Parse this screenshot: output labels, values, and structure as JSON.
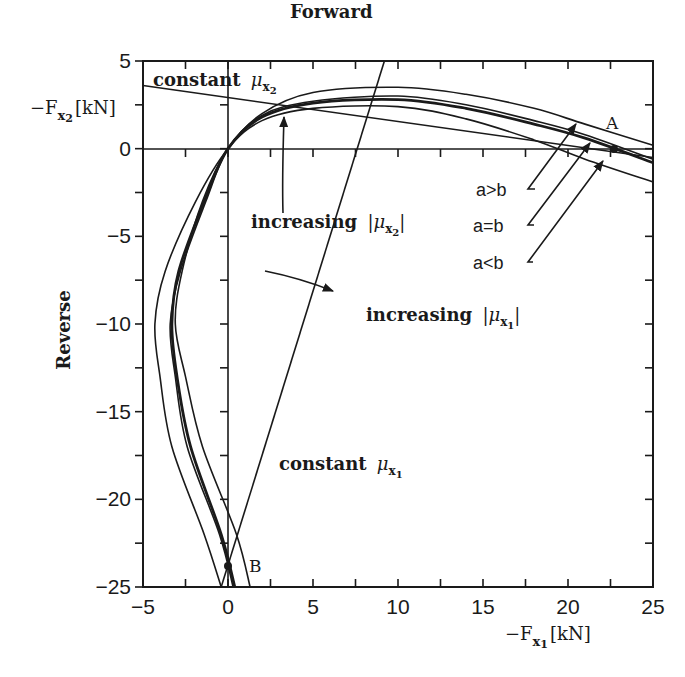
{
  "chart_data": {
    "type": "line",
    "title": "",
    "xlabel": "-F_x1 [kN]",
    "ylabel": "-F_x2 [kN]",
    "xlim": [
      -5,
      25
    ],
    "ylim": [
      -25,
      5
    ],
    "x_ticks": [
      -5,
      0,
      5,
      10,
      15,
      20,
      25
    ],
    "y_ticks": [
      5,
      0,
      -5,
      -10,
      -15,
      -20,
      -25
    ],
    "grid": false,
    "zero_lines": true,
    "labels": {
      "x_axis_prefix": "−F",
      "x_axis_sub": "x",
      "x_axis_subsub": "1",
      "x_axis_unit": "[kN]",
      "y_axis_prefix": "−F",
      "y_axis_sub": "x",
      "y_axis_subsub": "2",
      "y_axis_unit": "[kN]",
      "forward": "Forward",
      "reverse": "Reverse",
      "constant_mu_x2": "constant",
      "constant_mu_x1": "constant",
      "mu": "μ",
      "increasing_mu_x2": "increasing",
      "increasing_mu_x1": "increasing",
      "a_gt_b": "a>b",
      "a_eq_b": "a=b",
      "a_lt_b": "a<b",
      "point_A": "A",
      "point_B": "B"
    },
    "series": [
      {
        "name": "outer envelope",
        "x": [
          1.3,
          0.5,
          -1.5,
          -2.5,
          -3.1,
          -2.7,
          -1.5,
          0,
          2,
          5,
          10,
          14,
          18,
          21,
          25
        ],
        "y": [
          -25,
          -22,
          -17,
          -13,
          -10,
          -7,
          -3,
          0,
          2,
          3.2,
          3.5,
          3.1,
          2.3,
          1.4,
          0.2
        ]
      },
      {
        "name": "a>b",
        "x": [
          0.3,
          -0.5,
          -2.4,
          -3.1,
          -3.4,
          -2.8,
          -1.3,
          0,
          2,
          5,
          10,
          14,
          18,
          21,
          25
        ],
        "y": [
          -25,
          -22,
          -17,
          -13,
          -10,
          -7,
          -3,
          0,
          1.9,
          2.7,
          3.0,
          2.5,
          1.6,
          0.8,
          -0.6
        ]
      },
      {
        "name": "a=b",
        "x": [
          0.4,
          -0.4,
          -2.2,
          -3.0,
          -3.3,
          -2.9,
          -1.4,
          0,
          2,
          5,
          10,
          14,
          18,
          21,
          25
        ],
        "y": [
          -25,
          -22,
          -17,
          -13,
          -10,
          -7,
          -3,
          0,
          1.8,
          2.6,
          2.8,
          2.3,
          1.4,
          0.6,
          -0.8
        ]
      },
      {
        "name": "a<b",
        "x": [
          -0.4,
          -1.4,
          -3.3,
          -4.0,
          -4.3,
          -3.7,
          -1.9,
          0,
          2,
          5,
          10,
          14,
          18,
          21,
          25
        ],
        "y": [
          -25,
          -22,
          -17,
          -13,
          -10,
          -7,
          -3,
          0,
          1.6,
          2.3,
          2.4,
          1.7,
          0.5,
          -0.6,
          -1.9
        ]
      },
      {
        "name": "constant mu_x2 line",
        "x": [
          -5,
          25
        ],
        "y": [
          3.6,
          -0.5
        ]
      },
      {
        "name": "constant mu_x1 line",
        "x": [
          -0.4,
          9.2
        ],
        "y": [
          -25,
          5
        ]
      }
    ],
    "points": [
      {
        "name": "A",
        "x": 22.8,
        "y": 0
      },
      {
        "name": "B",
        "x": 0,
        "y": -23.8
      }
    ]
  }
}
